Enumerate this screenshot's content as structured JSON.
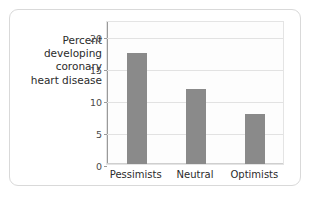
{
  "card": {
    "border_color": "#d9d9d9",
    "background": "#ffffff"
  },
  "chart_data": {
    "type": "bar",
    "title": "",
    "subtitle": "",
    "xlabel": "",
    "ylabel": "Percent\ndeveloping\ncoronary\nheart disease",
    "ylabel_flat": "Percent developing coronary heart disease",
    "categories": [
      "Pessimists",
      "Neutral",
      "Optimists"
    ],
    "values": [
      17.3,
      11.7,
      7.8
    ],
    "series": [
      {
        "name": "Percent developing coronary heart disease",
        "values": [
          17.3,
          11.7,
          7.8
        ]
      }
    ],
    "ylim": [
      0,
      22.5
    ],
    "yticks": [
      0,
      5,
      10,
      15,
      20
    ],
    "ytick_labels": [
      "0",
      "5",
      "10",
      "15",
      "20"
    ],
    "grid": "horizontal",
    "legend": "none",
    "bar_color": "#8a8a8a",
    "plot_background": "#fdfdfd",
    "grid_color": "#e2e2e2",
    "axis_color": "#9a9a9a"
  }
}
